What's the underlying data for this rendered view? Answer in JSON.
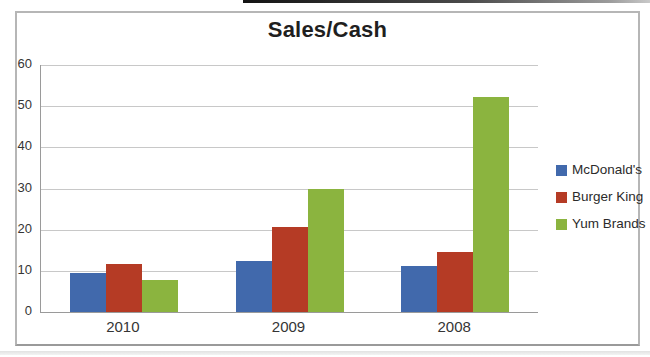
{
  "chart_data": {
    "type": "bar",
    "title": "Sales/Cash",
    "xlabel": "",
    "ylabel": "",
    "categories": [
      "2010",
      "2009",
      "2008"
    ],
    "series": [
      {
        "name": "McDonald's",
        "color": "#4169ac",
        "values": [
          9.5,
          12.3,
          11.2
        ]
      },
      {
        "name": "Burger King",
        "color": "#b53b25",
        "values": [
          11.6,
          20.6,
          14.6
        ]
      },
      {
        "name": "Yum Brands",
        "color": "#8bb43f",
        "values": [
          7.7,
          29.9,
          52.3
        ]
      }
    ],
    "ylim": [
      0,
      60
    ],
    "yticks": [
      0,
      10,
      20,
      30,
      40,
      50,
      60
    ],
    "grid": true,
    "legend_position": "right"
  },
  "colors": {
    "gridline": "#c8c8c8",
    "axis": "#9a9a9a",
    "frame_border": "#b6b6b6",
    "tick_text": "#353535",
    "title_text": "#1f1f1f"
  }
}
